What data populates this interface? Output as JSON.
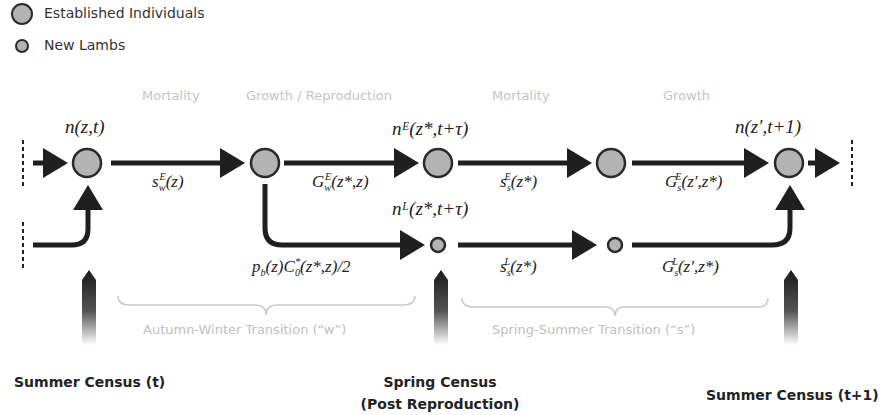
{
  "legend": {
    "items": [
      {
        "label": "Established Individuals",
        "icon": "large-circle"
      },
      {
        "label": "New Lambs",
        "icon": "small-circle"
      }
    ]
  },
  "phases": {
    "mortality_1": "Mortality",
    "growth_reproduction": "Growth  / Reproduction",
    "mortality_2": "Mortality",
    "growth_2": "Growth"
  },
  "nodes": {
    "n_z_t": "n(z,t)",
    "nE": "nᴱ(z*,t+τ)",
    "nL": "nᴸ(z*,t+τ)",
    "n_next": "n(z′,t+1)"
  },
  "edges": {
    "s_w_E": {
      "base": "s",
      "sub": "w",
      "sup": "E",
      "arg": "(z)"
    },
    "G_w_E": {
      "base": "G",
      "sub": "w",
      "sup": "E",
      "arg": "(z*,z)"
    },
    "s_s_E": {
      "base": "s",
      "sub": "s",
      "sup": "E",
      "arg": "(z*)"
    },
    "G_s_E": {
      "base": "G",
      "sub": "s",
      "sup": "E",
      "arg": "(z′,z*)"
    },
    "repro": {
      "p": "p",
      "p_sub": "b",
      "p_arg": "(z)",
      "c": "C",
      "c_sub": "0",
      "c_sup": "*",
      "c_arg": "(z*,z)/2"
    },
    "s_s_L": {
      "base": "s",
      "sub": "s",
      "sup": "L",
      "arg": "(z*)"
    },
    "G_s_L": {
      "base": "G",
      "sub": "s",
      "sup": "L",
      "arg": "(z′,z*)"
    }
  },
  "transitions": {
    "autumn_winter": "Autumn-Winter Transition (“w”)",
    "spring_summer": "Spring-Summer Transition (“s”)"
  },
  "census": {
    "summer_t": "Summer Census (t)",
    "spring_line1": "Spring Census",
    "spring_line2": "(Post Reproduction)",
    "summer_t1": "Summer Census (t+1)"
  },
  "colors": {
    "node_fill": "#b3b3b3",
    "node_stroke": "#2a2a2a",
    "arrow": "#1f1f1f",
    "phase_text": "#c4c4c4"
  }
}
